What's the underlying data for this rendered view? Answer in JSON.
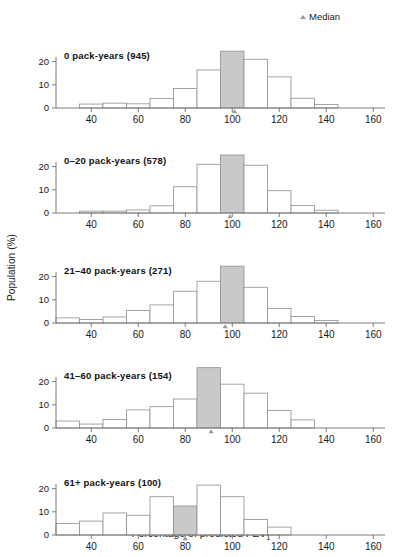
{
  "legend": {
    "label": "Median",
    "marker": "triangle-up-icon"
  },
  "axes": {
    "ylabel": "Population (%)",
    "xlabel_main": "Percentage of predicted FEV",
    "xlabel_sub": "1",
    "yticks": [
      0,
      10,
      20
    ],
    "xticks": [
      40,
      60,
      80,
      100,
      120,
      140,
      160
    ],
    "xlim": [
      25,
      165
    ],
    "ylim": [
      0,
      27
    ]
  },
  "colors": {
    "median_fill": "#c9c9c9",
    "bar_stroke": "#8f8f8f",
    "axis": "#6e6e6e",
    "text": "#1a1a1a"
  },
  "chart_data": {
    "type": "bar",
    "title": "",
    "xlabel": "Percentage of predicted FEV1",
    "ylabel": "Population (%)",
    "xlim": [
      25,
      165
    ],
    "ylim": [
      0,
      27
    ],
    "grid": false,
    "legend": [
      "Median"
    ],
    "legend_position": "top-right",
    "bin_width": 10,
    "panels": [
      {
        "title": "0 pack-years (945)",
        "group": "0 pack-years",
        "n": 945,
        "median": 101,
        "median_bin": [
          95,
          105
        ],
        "bins": [
          25,
          35,
          45,
          55,
          65,
          75,
          85,
          95,
          105,
          115,
          125,
          135,
          145
        ],
        "values": [
          0,
          1.7,
          2.1,
          1.8,
          4.1,
          8.4,
          16.4,
          24.5,
          21.0,
          13.4,
          4.2,
          1.5
        ]
      },
      {
        "title": "0–20 pack-years (578)",
        "group": "0-20 pack-years",
        "n": 578,
        "median": 99,
        "median_bin": [
          95,
          105
        ],
        "bins": [
          25,
          35,
          45,
          55,
          65,
          75,
          85,
          95,
          105,
          115,
          125,
          135,
          145
        ],
        "values": [
          0,
          0.8,
          0.8,
          1.3,
          3.1,
          11.3,
          21.0,
          25.0,
          20.6,
          9.6,
          3.2,
          1.2
        ]
      },
      {
        "title": "21–40 pack-years (271)",
        "group": "21-40 pack-years",
        "n": 271,
        "median": 97,
        "median_bin": [
          95,
          105
        ],
        "bins": [
          25,
          35,
          45,
          55,
          65,
          75,
          85,
          95,
          105,
          115,
          125,
          135,
          145
        ],
        "values": [
          2.2,
          1.5,
          2.6,
          5.4,
          7.8,
          13.7,
          18.0,
          24.5,
          15.4,
          6.3,
          2.8,
          1.1
        ]
      },
      {
        "title": "41–60 pack-years (154)",
        "group": "41-60 pack-years",
        "n": 154,
        "median": 91,
        "median_bin": [
          85,
          95
        ],
        "bins": [
          25,
          35,
          45,
          55,
          65,
          75,
          85,
          95,
          105,
          115,
          125,
          135
        ],
        "values": [
          3.0,
          1.7,
          3.7,
          7.8,
          9.2,
          12.5,
          26.0,
          18.9,
          15.0,
          7.6,
          3.5
        ]
      },
      {
        "title": "61+ pack-years (100)",
        "group": "61+ pack-years",
        "n": 100,
        "median": 80,
        "median_bin": [
          75,
          85
        ],
        "bins": [
          25,
          35,
          45,
          55,
          65,
          75,
          85,
          95,
          105,
          115,
          125
        ],
        "values": [
          5.0,
          6.0,
          9.5,
          8.5,
          16.5,
          12.5,
          21.5,
          16.5,
          6.7,
          3.4
        ]
      }
    ]
  }
}
